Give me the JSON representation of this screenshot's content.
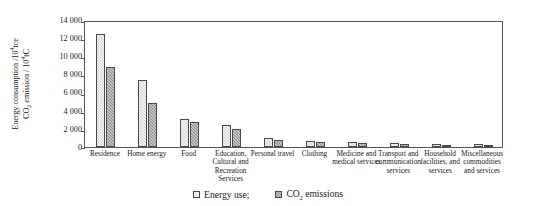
{
  "chart_data": {
    "type": "bar",
    "title": "",
    "xlabel": "",
    "ylabel_line1": "Energy consumption /10",
    "ylabel_line1_sup": "4",
    "ylabel_line1_tail": "tce",
    "ylabel_line2": "CO",
    "ylabel_line2_sub": "2",
    "ylabel_line2_tail": " emission / 10",
    "ylabel_line2_sup": "4",
    "ylabel_line2_tail2": "tC",
    "ylim": [
      0,
      14000
    ],
    "yticks": [
      "0",
      "2 000",
      "4 000",
      "6 000",
      "8 000",
      "10 000",
      "12 000",
      "14 000"
    ],
    "ytick_values": [
      0,
      2000,
      4000,
      6000,
      8000,
      10000,
      12000,
      14000
    ],
    "grid": false,
    "legend_position": "bottom-center",
    "categories": [
      "Residence",
      "Home energy",
      "Food",
      "Education, Cultural and Recreation Services",
      "Personal travel",
      "Clothing",
      "Medicine and medical services",
      "Transport and communication services",
      "Household facilities, and services",
      "Miscellaneous commodities and services"
    ],
    "series": [
      {
        "name": "Energy use;",
        "key": "energy",
        "values": [
          12450,
          7350,
          3100,
          2400,
          1000,
          700,
          600,
          400,
          350,
          300
        ]
      },
      {
        "name": "CO2 emissions",
        "key": "co2",
        "values": [
          8800,
          4900,
          2750,
          2000,
          800,
          500,
          420,
          300,
          260,
          220
        ]
      }
    ]
  },
  "legend": {
    "items": [
      {
        "label": "Energy use;",
        "key": "energy"
      },
      {
        "label": "CO",
        "sub": "2",
        "tail": " emissions",
        "key": "co2"
      }
    ]
  }
}
